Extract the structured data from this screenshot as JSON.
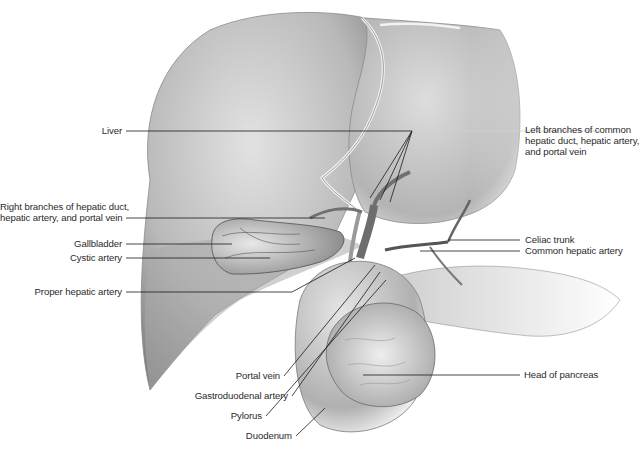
{
  "figure": {
    "colors": {
      "background": "#ffffff",
      "organ_light": "#d9d9d9",
      "organ_mid": "#a8a8a8",
      "organ_dark": "#6e6e6e",
      "leader_line": "#1a1a1a",
      "label_text": "#2a2a2a"
    }
  },
  "labels_left": [
    {
      "id": "liver",
      "text": "Liver"
    },
    {
      "id": "right-branches",
      "line1": "Right branches of hepatic duct,",
      "line2": "hepatic artery, and portal vein"
    },
    {
      "id": "gallbladder",
      "text": "Gallbladder"
    },
    {
      "id": "cystic-artery",
      "text": "Cystic artery"
    },
    {
      "id": "proper-hepatic-artery",
      "text": "Proper hepatic artery"
    },
    {
      "id": "portal-vein",
      "text": "Portal vein"
    },
    {
      "id": "gastroduodenal-artery",
      "text": "Gastroduodenal artery"
    },
    {
      "id": "pylorus",
      "text": "Pylorus"
    },
    {
      "id": "duodenum",
      "text": "Duodenum"
    }
  ],
  "labels_right": [
    {
      "id": "left-branches",
      "line1": "Left branches of common",
      "line2": "hepatic duct, hepatic artery,",
      "line3": "and portal vein"
    },
    {
      "id": "celiac-trunk",
      "text": "Celiac trunk"
    },
    {
      "id": "common-hepatic-artery",
      "text": "Common hepatic artery"
    },
    {
      "id": "head-of-pancreas",
      "text": "Head of pancreas"
    }
  ]
}
